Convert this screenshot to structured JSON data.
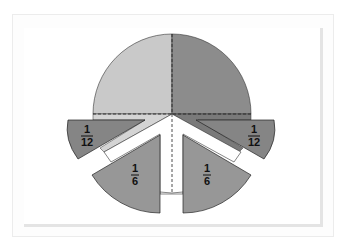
{
  "diagram": {
    "title": "",
    "colors": {
      "light_quarter": "#c8c8c8",
      "dark_quarter": "#8a8a8a",
      "twelfth_piece": "#858585",
      "sixth_piece": "#959595",
      "strip_light": "#d6d6d6",
      "strip_dark": "#6e6e6e",
      "outline": "#222222",
      "background": "#ffffff"
    },
    "pieces": [
      {
        "id": "left-twelfth",
        "numerator": "1",
        "denominator": "12"
      },
      {
        "id": "right-twelfth",
        "numerator": "1",
        "denominator": "12"
      },
      {
        "id": "left-sixth",
        "numerator": "1",
        "denominator": "6"
      },
      {
        "id": "right-sixth",
        "numerator": "1",
        "denominator": "6"
      }
    ]
  }
}
